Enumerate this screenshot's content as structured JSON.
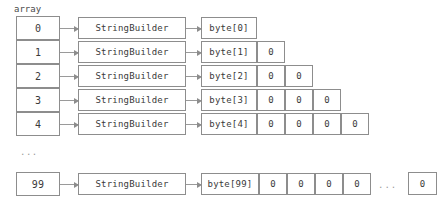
{
  "diagram": {
    "title_label": "array",
    "ellipsis_vertical": "...",
    "ellipsis_horizontal": "...",
    "object_label": "StringBuilder",
    "zero_value": "0",
    "colors": {
      "border": "#8d8d8d",
      "text": "#3a3a3a",
      "muted": "#9a9a9a",
      "background": "#ffffff"
    },
    "rows": [
      {
        "index": "0",
        "object": "StringBuilder",
        "buffer": "byte[0]",
        "zeros": []
      },
      {
        "index": "1",
        "object": "StringBuilder",
        "buffer": "byte[1]",
        "zeros": [
          "0"
        ]
      },
      {
        "index": "2",
        "object": "StringBuilder",
        "buffer": "byte[2]",
        "zeros": [
          "0",
          "0"
        ]
      },
      {
        "index": "3",
        "object": "StringBuilder",
        "buffer": "byte[3]",
        "zeros": [
          "0",
          "0",
          "0"
        ]
      },
      {
        "index": "4",
        "object": "StringBuilder",
        "buffer": "byte[4]",
        "zeros": [
          "0",
          "0",
          "0",
          "0"
        ]
      },
      {
        "index": "99",
        "object": "StringBuilder",
        "buffer": "byte[99]",
        "zeros": [
          "0",
          "0",
          "0",
          "0"
        ],
        "tail_zero": "0"
      }
    ]
  }
}
